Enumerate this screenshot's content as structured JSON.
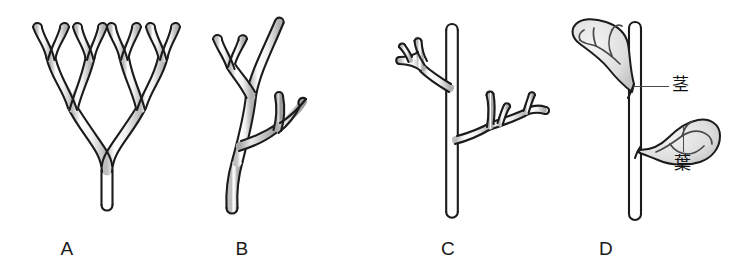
{
  "figure": {
    "background_color": "#ffffff",
    "outline_color": "#1b1b1b",
    "fill_light": "#ffffff",
    "fill_mid": "#d8d8d8",
    "fill_shaded": "#b9b9b9",
    "leader_color": "#4a4a4a"
  },
  "panels": [
    {
      "id": "A",
      "label": "A",
      "label_x": 47,
      "label_y": 238,
      "x": 18,
      "width": 178,
      "description": "equal dichotomous branching system with a single basal stalk"
    },
    {
      "id": "B",
      "label": "B",
      "label_x": 222,
      "label_y": 238,
      "x": 185,
      "width": 170,
      "description": "unequal branching, overtopping main axis with lateral forked branchlets"
    },
    {
      "id": "C",
      "label": "C",
      "label_x": 428,
      "label_y": 238,
      "x": 380,
      "width": 190,
      "description": "planated lateral branch systems on a dominant straight main axis"
    },
    {
      "id": "D",
      "label": "D",
      "label_x": 586,
      "label_y": 238,
      "x": 560,
      "width": 193,
      "description": "webbed lateral branch systems forming leaf blades on a stem"
    }
  ],
  "callouts": [
    {
      "id": "stem",
      "text": "茎",
      "text_x": 672,
      "text_y": 76,
      "leader": {
        "orientation": "horizontal",
        "x": 633,
        "y": 86,
        "length": 36
      }
    },
    {
      "id": "leaf",
      "text": "葉",
      "text_x": 674,
      "text_y": 155,
      "leader": {
        "orientation": "vertical",
        "x": 683,
        "y": 126,
        "length": 26
      }
    }
  ]
}
